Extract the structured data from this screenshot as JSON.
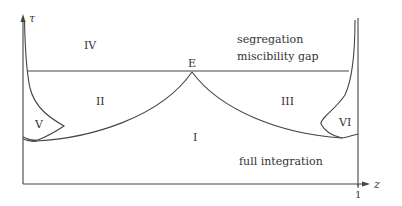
{
  "diagram": {
    "type": "phase-diagram",
    "axes": {
      "y_label": "τ",
      "x_label": "z",
      "x_tick": "1"
    },
    "point_labels": {
      "E": "E"
    },
    "regions": {
      "I": "I",
      "II": "II",
      "III": "III",
      "IV": "IV",
      "V": "V",
      "VI": "VI"
    },
    "annotations": {
      "segregation": "segregation",
      "miscibility_gap": "miscibility gap",
      "full_integration": "full integration"
    },
    "colors": {
      "line": "#444444",
      "text": "#333333",
      "background": "#ffffff"
    }
  }
}
